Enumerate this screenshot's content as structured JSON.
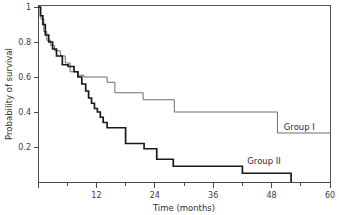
{
  "chart_data": {
    "type": "line",
    "title": "",
    "xlabel": "Time (months)",
    "ylabel": "Probability of survival",
    "xlim": [
      0,
      60
    ],
    "ylim": [
      0,
      1
    ],
    "grid": false,
    "legend_position": "inline-right",
    "x_ticks_major": [
      0,
      12,
      24,
      36,
      48,
      60
    ],
    "x_tick_labels": [
      "",
      "12",
      "24",
      "36",
      "48",
      "60"
    ],
    "x_ticks_minor": [
      6,
      18,
      30,
      42,
      54
    ],
    "y_ticks": [
      0,
      0.2,
      0.4,
      0.6,
      0.8,
      1
    ],
    "y_tick_labels": [
      "",
      "0.2",
      "0.4",
      "0.6",
      "0.8",
      "1"
    ],
    "series": [
      {
        "name": "Group I",
        "style": "thin-gray",
        "color": "#6e6e6e",
        "label_x": 50.5,
        "label_y": 0.3,
        "steps_x": [
          0,
          0.6,
          0.6,
          1.2,
          1.2,
          1.8,
          1.8,
          2.6,
          2.6,
          3.4,
          3.4,
          4.6,
          4.6,
          5.6,
          5.6,
          6.6,
          6.6,
          8.2,
          8.2,
          9.4,
          9.4,
          10.6,
          10.6,
          14.2,
          14.2,
          15.8,
          15.8,
          21.6,
          21.6,
          28.0,
          28.0,
          49.2,
          49.2,
          60
        ],
        "steps_y": [
          1.0,
          1.0,
          0.93,
          0.93,
          0.86,
          0.86,
          0.81,
          0.81,
          0.78,
          0.78,
          0.75,
          0.75,
          0.72,
          0.72,
          0.68,
          0.68,
          0.63,
          0.63,
          0.61,
          0.61,
          0.6,
          0.6,
          0.6,
          0.6,
          0.57,
          0.57,
          0.51,
          0.51,
          0.47,
          0.47,
          0.4,
          0.4,
          0.28,
          0.28
        ]
      },
      {
        "name": "Group II",
        "style": "thick-black",
        "color": "#1a1a1a",
        "label_x": 43.0,
        "label_y": 0.105,
        "steps_x": [
          0,
          0.5,
          0.5,
          1.0,
          1.0,
          1.5,
          1.5,
          2.2,
          2.2,
          3.0,
          3.0,
          3.8,
          3.8,
          5.0,
          5.0,
          6.2,
          6.2,
          7.4,
          7.4,
          8.2,
          8.2,
          9.0,
          9.0,
          9.8,
          9.8,
          10.4,
          10.4,
          11.0,
          11.0,
          11.6,
          11.6,
          12.2,
          12.2,
          12.8,
          12.8,
          13.4,
          13.4,
          14.2,
          14.2,
          18.0,
          18.0,
          21.8,
          21.8,
          24.4,
          24.4,
          27.8,
          27.8,
          42.0,
          42.0,
          52.0,
          52.0
        ],
        "steps_y": [
          1.0,
          1.0,
          0.95,
          0.95,
          0.9,
          0.9,
          0.84,
          0.84,
          0.8,
          0.8,
          0.76,
          0.76,
          0.72,
          0.72,
          0.67,
          0.67,
          0.66,
          0.66,
          0.63,
          0.63,
          0.6,
          0.6,
          0.56,
          0.56,
          0.52,
          0.52,
          0.48,
          0.48,
          0.45,
          0.45,
          0.42,
          0.42,
          0.4,
          0.4,
          0.37,
          0.37,
          0.34,
          0.34,
          0.31,
          0.31,
          0.22,
          0.22,
          0.19,
          0.19,
          0.13,
          0.13,
          0.09,
          0.09,
          0.05,
          0.05,
          0.0
        ]
      }
    ]
  },
  "axes": {
    "y_title": "Probability of survival",
    "x_title": "Time (months)"
  },
  "labels": {
    "group1": "Group I",
    "group2": "Group II"
  },
  "y_tick_texts": {
    "t1": "1",
    "t08": "0.8",
    "t06": "0.6",
    "t04": "0.4",
    "t02": "0.2"
  },
  "x_tick_texts": {
    "t12": "12",
    "t24": "24",
    "t36": "36",
    "t48": "48",
    "t60": "60"
  }
}
